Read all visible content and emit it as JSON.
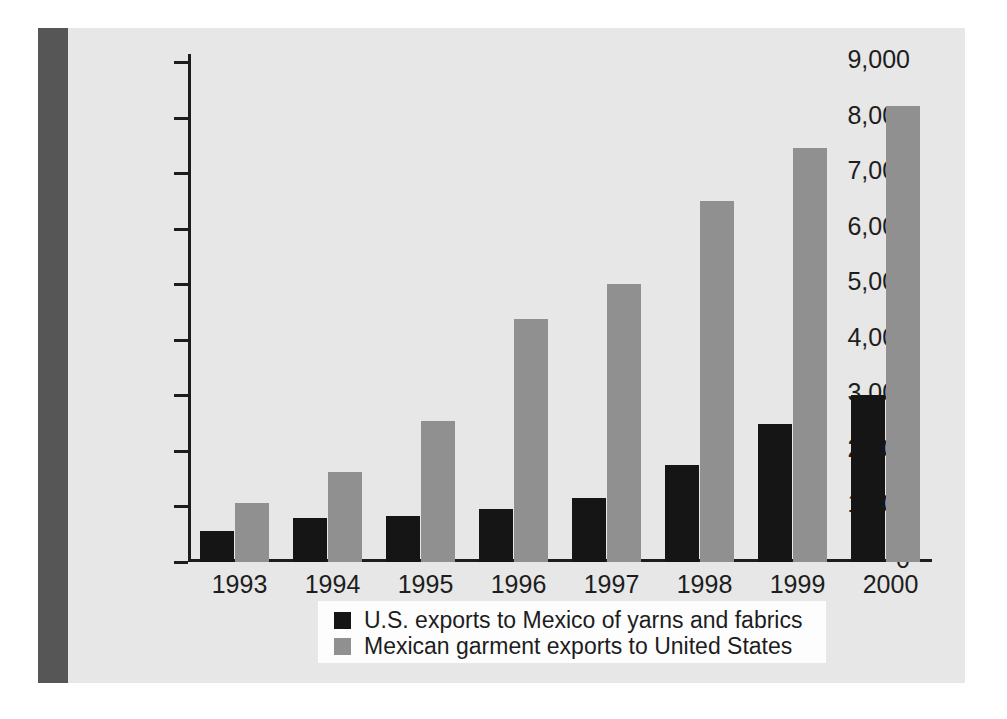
{
  "chart_data": {
    "type": "bar",
    "title": "",
    "subtitle": "",
    "xlabel": "",
    "ylabel": "",
    "categories": [
      "1993",
      "1994",
      "1995",
      "1996",
      "1997",
      "1998",
      "1999",
      "2000"
    ],
    "series": [
      {
        "name": "U.S. exports to Mexico of yarns and fabrics",
        "color": "#151515",
        "values": [
          550,
          800,
          830,
          960,
          1150,
          1750,
          2480,
          3000
        ]
      },
      {
        "name": "Mexican garment exports to United States",
        "color": "#909090",
        "values": [
          1060,
          1620,
          2530,
          4380,
          5000,
          6500,
          7450,
          8200
        ]
      }
    ],
    "ylim": [
      0,
      9000
    ],
    "ytick_labels": [
      "9,000",
      "8,000",
      "7,000",
      "6,000",
      "5,000",
      "4,000",
      "3,000",
      "2,000",
      "1,000",
      "0"
    ],
    "ytick_values": [
      9000,
      8000,
      7000,
      6000,
      5000,
      4000,
      3000,
      2000,
      1000,
      0
    ],
    "grid": false,
    "legend_position": "bottom-center"
  },
  "figure": {
    "background_color": "#e6e7e6",
    "spine_color": "#565656",
    "axis_color": "#1d1d1d",
    "legend_background": "#fdfdfd"
  }
}
